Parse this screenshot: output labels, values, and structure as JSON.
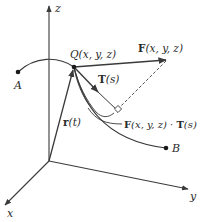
{
  "figure": {
    "axes": {
      "z_label": "z",
      "y_label": "y",
      "x_label": "x"
    },
    "points": {
      "A_label": "A",
      "B_label": "B",
      "Q_label": "Q(x, y, z)"
    },
    "vectors": {
      "F_label_bold": "F",
      "F_label_args": "(x, y, z)",
      "T_label_bold": "T",
      "T_label_args": "(s)",
      "r_label_bold": "r",
      "r_label_args": "(t)"
    },
    "projection": {
      "label_F_bold": "F",
      "label_F_args": "(x, y, z) · ",
      "label_T_bold": "T",
      "label_T_args": "(s)"
    },
    "colors": {
      "stroke": "#3a3a3a",
      "dot": "#1a1a1a",
      "text": "#2a2a2a"
    }
  }
}
